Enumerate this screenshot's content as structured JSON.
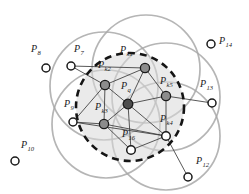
{
  "figure": {
    "name": "k-nearest-neighbor coverage diagram",
    "background": "#ffffff"
  },
  "colors": {
    "node_stroke": "#1a1a1a",
    "node_fill_hollow": "#ffffff",
    "node_fill_gray": "#8c8c8c",
    "node_fill_dark": "#4d4d4d",
    "edge": "#3a3a3a",
    "coverage_circle": "#a8a8a8",
    "query_circle": "#151515",
    "query_fill": "#d9d9d9",
    "label": "#1a1a1a"
  },
  "chart_data": {
    "type": "scatter",
    "title": "",
    "xlabel": "",
    "ylabel": "",
    "xlim": [
      0,
      249
    ],
    "ylim": [
      0,
      194
    ],
    "grid": false,
    "legend": null,
    "nodes": [
      {
        "id": "P8",
        "label": "P",
        "subscript": "8",
        "x": 46,
        "y": 68,
        "style": "hollow",
        "r": 4.0,
        "label_x": 31,
        "label_y": 52
      },
      {
        "id": "P10",
        "label": "P",
        "subscript": "10",
        "x": 15,
        "y": 161,
        "style": "hollow",
        "r": 4.0,
        "label_x": 21,
        "label_y": 148
      },
      {
        "id": "P14",
        "label": "P",
        "subscript": "14",
        "x": 211,
        "y": 44,
        "style": "hollow",
        "r": 4.0,
        "label_x": 219,
        "label_y": 44
      },
      {
        "id": "P13",
        "label": "P",
        "subscript": "13",
        "x": 212,
        "y": 103,
        "style": "hollow",
        "r": 4.0,
        "label_x": 200,
        "label_y": 87
      },
      {
        "id": "P12",
        "label": "P",
        "subscript": "12",
        "x": 188,
        "y": 177,
        "style": "hollow",
        "r": 4.0,
        "label_x": 196,
        "label_y": 164
      },
      {
        "id": "P7",
        "label": "P",
        "subscript": "7",
        "x": 71,
        "y": 66,
        "style": "hollow",
        "r": 4.0,
        "label_x": 74,
        "label_y": 52
      },
      {
        "id": "P9",
        "label": "P",
        "subscript": "9",
        "x": 73,
        "y": 122,
        "style": "hollow",
        "r": 4.0,
        "label_x": 64,
        "label_y": 107
      },
      {
        "id": "Pk1",
        "label": "P",
        "subscript": "k1",
        "x": 145,
        "y": 68,
        "style": "gray",
        "r": 4.6,
        "label_x": 120,
        "label_y": 53
      },
      {
        "id": "Pk2",
        "label": "P",
        "subscript": "k2",
        "x": 105,
        "y": 85,
        "style": "gray",
        "r": 4.6,
        "label_x": 98,
        "label_y": 68
      },
      {
        "id": "Pk3",
        "label": "P",
        "subscript": "k3",
        "x": 104,
        "y": 124,
        "style": "gray",
        "r": 4.6,
        "label_x": 95,
        "label_y": 110
      },
      {
        "id": "Pk5",
        "label": "P",
        "subscript": "k5",
        "x": 166,
        "y": 96,
        "style": "gray",
        "r": 4.6,
        "label_x": 160,
        "label_y": 84
      },
      {
        "id": "Pk4",
        "label": "P",
        "subscript": "k4",
        "x": 166,
        "y": 136,
        "style": "hollow",
        "r": 4.3,
        "label_x": 160,
        "label_y": 122
      },
      {
        "id": "Pq",
        "label": "P",
        "subscript": "q",
        "x": 128,
        "y": 104,
        "style": "dark",
        "r": 4.8,
        "label_x": 121,
        "label_y": 89
      },
      {
        "id": "P16",
        "label": "P",
        "subscript": "16",
        "x": 131,
        "y": 150,
        "style": "hollow",
        "r": 4.3,
        "label_x": 122,
        "label_y": 137
      }
    ],
    "edges": [
      [
        "P7",
        "Pk2"
      ],
      [
        "P7",
        "Pk1"
      ],
      [
        "Pk2",
        "Pk1"
      ],
      [
        "Pk2",
        "Pq"
      ],
      [
        "Pk2",
        "Pk3"
      ],
      [
        "Pk2",
        "P9"
      ],
      [
        "Pk1",
        "Pq"
      ],
      [
        "Pk1",
        "Pk5"
      ],
      [
        "Pq",
        "Pk5"
      ],
      [
        "Pq",
        "Pk3"
      ],
      [
        "Pq",
        "P16"
      ],
      [
        "Pq",
        "Pk4"
      ],
      [
        "Pk5",
        "Pk4"
      ],
      [
        "Pk5",
        "P13"
      ],
      [
        "P9",
        "Pk3"
      ],
      [
        "P9",
        "Pk4"
      ],
      [
        "Pk3",
        "P16"
      ],
      [
        "Pk3",
        "Pk4"
      ],
      [
        "P16",
        "Pk4"
      ],
      [
        "Pk4",
        "P12"
      ]
    ],
    "coverage_circles": [
      {
        "cx": 104,
        "cy": 86,
        "r": 54
      },
      {
        "cx": 146,
        "cy": 69,
        "r": 54
      },
      {
        "cx": 166,
        "cy": 97,
        "r": 54
      },
      {
        "cx": 106,
        "cy": 124,
        "r": 54
      },
      {
        "cx": 166,
        "cy": 136,
        "r": 54
      }
    ],
    "query_circle": {
      "cx": 130,
      "cy": 107,
      "r": 54,
      "dashed": true
    }
  }
}
